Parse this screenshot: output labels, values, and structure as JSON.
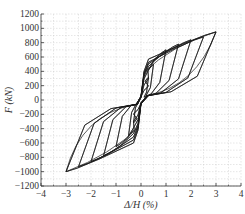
{
  "chart_data": {
    "type": "line",
    "title": "",
    "xlabel": "Δ/H (%)",
    "ylabel": "F (kN)",
    "xlim": [
      -4,
      4
    ],
    "ylim": [
      -1200,
      1200
    ],
    "xticks": [
      -4,
      -3,
      -2,
      -1,
      0,
      1,
      2,
      3,
      4
    ],
    "yticks": [
      -1200,
      -1000,
      -800,
      -600,
      -400,
      -200,
      0,
      200,
      400,
      600,
      800,
      1000,
      1200
    ],
    "xtick_labels": [
      "−4",
      "−3",
      "−2",
      "−1",
      "0",
      "1",
      "2",
      "3",
      "4"
    ],
    "ytick_labels": [
      "−1200",
      "−1000",
      "−800",
      "−600",
      "−400",
      "−200",
      "0",
      "200",
      "400",
      "600",
      "800",
      "1000",
      "1200"
    ],
    "grid": true,
    "legend": null,
    "line_color": "#1a1a1a",
    "grid_color": "#cccccc",
    "series": [
      {
        "name": "hysteresis",
        "peaks": [
          {
            "drift": 0.3,
            "force_pos": 320,
            "force_neg": -320
          },
          {
            "drift": 0.5,
            "force_pos": 500,
            "force_neg": -500
          },
          {
            "drift": 1.0,
            "force_pos": 700,
            "force_neg": -650
          },
          {
            "drift": 1.5,
            "force_pos": 780,
            "force_neg": -780
          },
          {
            "drift": 2.0,
            "force_pos": 840,
            "force_neg": -860
          },
          {
            "drift": 2.5,
            "force_pos": 880,
            "force_neg": -930
          },
          {
            "drift": 3.0,
            "force_pos": 950,
            "force_neg": -1000
          }
        ]
      }
    ]
  }
}
